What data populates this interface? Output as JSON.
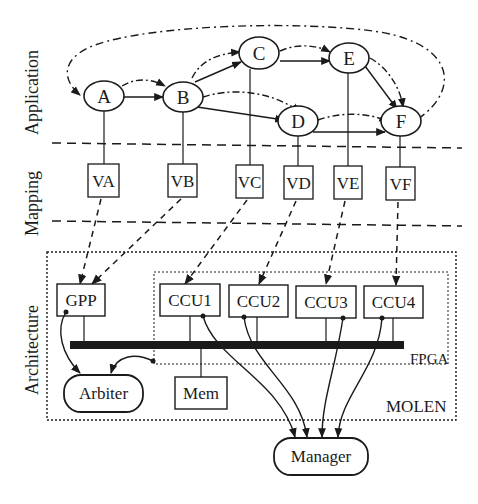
{
  "layers": {
    "application": "Application",
    "mapping": "Mapping",
    "architecture": "Architecture"
  },
  "application_nodes": [
    "A",
    "B",
    "C",
    "D",
    "E",
    "F"
  ],
  "mapping_nodes": [
    "VA",
    "VB",
    "VC",
    "VD",
    "VE",
    "VF"
  ],
  "architecture": {
    "gpp": "GPP",
    "ccus": [
      "CCU1",
      "CCU2",
      "CCU3",
      "CCU4"
    ],
    "fpga": "FPGA",
    "molen": "MOLEN",
    "arbiter": "Arbiter",
    "mem": "Mem",
    "manager": "Manager"
  },
  "edges": {
    "control_flow": [
      [
        "A",
        "B"
      ],
      [
        "B",
        "C"
      ],
      [
        "B",
        "D"
      ],
      [
        "C",
        "E"
      ],
      [
        "D",
        "F"
      ],
      [
        "E",
        "F"
      ]
    ],
    "data_flow": [
      [
        "A",
        "B"
      ],
      [
        "B",
        "C"
      ],
      [
        "B",
        "D"
      ],
      [
        "C",
        "E"
      ],
      [
        "D",
        "F"
      ],
      [
        "E",
        "F"
      ],
      [
        "F",
        "A"
      ]
    ],
    "mapping_to_arch": [
      [
        "VA",
        "GPP"
      ],
      [
        "VB",
        "GPP"
      ],
      [
        "VC",
        "CCU1"
      ],
      [
        "VD",
        "CCU2"
      ],
      [
        "VE",
        "CCU3"
      ],
      [
        "VF",
        "CCU4"
      ]
    ],
    "to_manager": [
      "CCU1",
      "CCU2",
      "CCU3",
      "CCU4"
    ],
    "to_arbiter": [
      "GPP",
      "FPGA"
    ]
  },
  "colors": {
    "ink": "#1a1a1a",
    "background": "#ffffff"
  }
}
